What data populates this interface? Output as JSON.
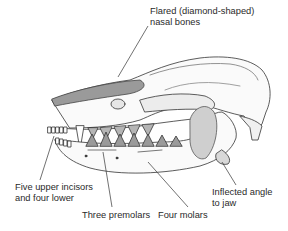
{
  "diagram": {
    "labels": {
      "nasal": [
        "Flared (diamond-shaped)",
        "nasal bones"
      ],
      "incisors": [
        "Five upper incisors",
        "and four lower"
      ],
      "premolars": [
        "Three premolars"
      ],
      "molars": [
        "Four molars"
      ],
      "angle": [
        "Inflected angle",
        "to jaw"
      ]
    },
    "colors": {
      "ink": "#2a2a2a",
      "shade": "#7a7a7a",
      "background": "#ffffff"
    }
  }
}
